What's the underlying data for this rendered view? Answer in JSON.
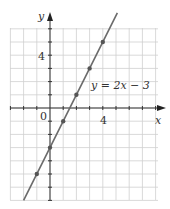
{
  "chart_data": {
    "type": "line",
    "title": "",
    "xlabel": "x",
    "ylabel": "y",
    "equation_label": "y = 2x − 3",
    "x_ticks": [
      {
        "value": 0,
        "label": "0"
      },
      {
        "value": 4,
        "label": "4"
      }
    ],
    "y_ticks": [
      {
        "value": 4,
        "label": "4"
      }
    ],
    "xlim": [
      -3,
      8
    ],
    "ylim": [
      -7,
      6
    ],
    "grid": true,
    "series": [
      {
        "name": "y = 2x - 3",
        "points": [
          {
            "x": -1,
            "y": -5
          },
          {
            "x": 0,
            "y": -3
          },
          {
            "x": 1,
            "y": -1
          },
          {
            "x": 2,
            "y": 1
          },
          {
            "x": 3,
            "y": 3
          },
          {
            "x": 4,
            "y": 5
          }
        ],
        "line_range_x": [
          -2,
          5.1
        ]
      }
    ]
  },
  "colors": {
    "grid": "#cfcfcf",
    "axis": "#333333",
    "line": "#6a6a6a",
    "point": "#555555"
  }
}
